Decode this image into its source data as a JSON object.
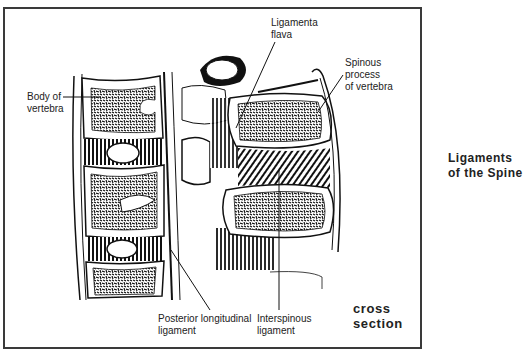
{
  "figure": {
    "title_line1": "Ligaments",
    "title_line2": "of the Spine",
    "caption_line1": "cross",
    "caption_line2": "section"
  },
  "labels": {
    "body_of_vertebra": {
      "line1": "Body of",
      "line2": "vertebra"
    },
    "ligamenta_flava": {
      "line1": "Ligamenta",
      "line2": "flava"
    },
    "spinous_process": {
      "line1": "Spinous",
      "line2": "process",
      "line3": "of vertebra"
    },
    "posterior_longitudinal": {
      "line1": "Posterior longitudinal",
      "line2": "ligament"
    },
    "interspinous": {
      "line1": "Interspinous",
      "line2": "ligament"
    }
  },
  "colors": {
    "ink": "#1a1a1a",
    "frame": "#3a3a3a",
    "background": "#ffffff"
  }
}
